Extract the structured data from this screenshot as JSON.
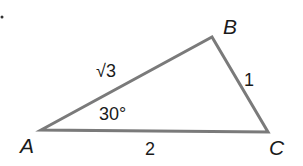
{
  "diagram": {
    "type": "triangle",
    "stroke_color": "#7a7a7a",
    "text_color": "#1a1a1a",
    "vertices": {
      "A": {
        "label": "A",
        "x": 41,
        "y": 130
      },
      "B": {
        "label": "B",
        "x": 212,
        "y": 37
      },
      "C": {
        "label": "C",
        "x": 268,
        "y": 132
      }
    },
    "sides": {
      "AB": {
        "label": "√3"
      },
      "BC": {
        "label": "1"
      },
      "AC": {
        "label": "2"
      }
    },
    "angles": {
      "A": {
        "label": "30°"
      }
    }
  }
}
